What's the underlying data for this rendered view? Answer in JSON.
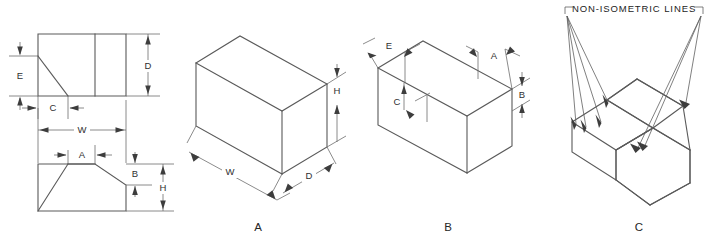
{
  "figure": {
    "background_color": "#ffffff",
    "line_color": "#5a5a5a",
    "text_color": "#262626",
    "arrow_color": "#3d3d3d"
  },
  "views": {
    "orthographic": {
      "name": "multiview-orthographic-drawing",
      "dimensions": {
        "e": "E",
        "c": "C",
        "d": "D",
        "w": "W",
        "a": "A",
        "b": "B",
        "h": "H"
      }
    },
    "iso_a": {
      "label": "A",
      "dimensions": {
        "h": "H",
        "w": "W",
        "d": "D"
      }
    },
    "iso_b": {
      "label": "B",
      "dimensions": {
        "e": "E",
        "a": "A",
        "b": "B",
        "c": "C"
      }
    },
    "iso_c": {
      "label": "C",
      "note": "NON-ISOMETRIC LINES"
    }
  }
}
